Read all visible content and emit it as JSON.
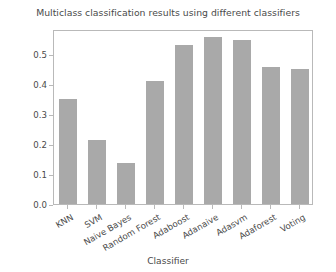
{
  "chart_data": {
    "type": "bar",
    "title": "Multiclass classification results using different classifiers",
    "xlabel": "Classifier",
    "ylabel": "Score",
    "categories": [
      "KNN",
      "SVM",
      "Naive Bayes",
      "Random Forest",
      "Adaboost",
      "Adanaive",
      "Adasvm",
      "Adaforest",
      "Voting"
    ],
    "values": [
      0.35,
      0.213,
      0.137,
      0.41,
      0.53,
      0.557,
      0.547,
      0.457,
      0.45
    ],
    "ylim": [
      0.0,
      0.585
    ],
    "yticks": [
      "0.0",
      "0.1",
      "0.2",
      "0.3",
      "0.4",
      "0.5"
    ],
    "ytick_values": [
      0.0,
      0.1,
      0.2,
      0.3,
      0.4,
      0.5
    ],
    "grid": false,
    "legend": "none",
    "bar_color": "#a9a9a9",
    "frame_color": "#b9b9b9",
    "text_color": "#4a4a4a",
    "background": "#ffffff"
  }
}
